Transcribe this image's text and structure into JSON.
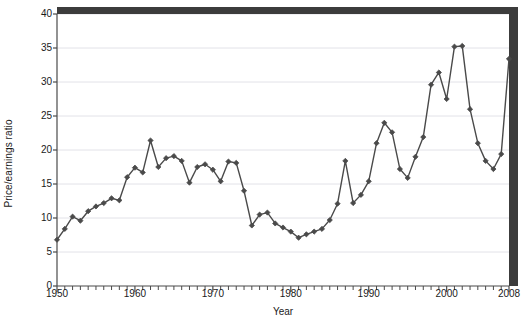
{
  "chart_data": {
    "type": "line",
    "title": "",
    "subtitle": "",
    "xlabel": "Year",
    "ylabel": "Price/earnings ratio",
    "xlim": [
      1950,
      2008
    ],
    "ylim": [
      0,
      40
    ],
    "xticks": [
      1950,
      1960,
      1970,
      1980,
      1990,
      2000,
      2008
    ],
    "xtick_labels": [
      "1950",
      "1960",
      "1970",
      "1980",
      "1990",
      "2000",
      "2008"
    ],
    "minor_xtick_interval": 1,
    "yticks": [
      0,
      5,
      10,
      15,
      20,
      25,
      30,
      35,
      40
    ],
    "ytick_labels": [
      "0",
      "5",
      "10",
      "15",
      "20",
      "25",
      "30",
      "35",
      "40"
    ],
    "grid": "horizontal",
    "legend": "none",
    "marker": "diamond",
    "series": [
      {
        "name": "Price/earnings ratio",
        "color": "#4a4a4a",
        "x": [
          1950,
          1951,
          1952,
          1953,
          1954,
          1955,
          1956,
          1957,
          1958,
          1959,
          1960,
          1961,
          1962,
          1963,
          1964,
          1965,
          1966,
          1967,
          1968,
          1969,
          1970,
          1971,
          1972,
          1973,
          1974,
          1975,
          1976,
          1977,
          1978,
          1979,
          1980,
          1981,
          1982,
          1983,
          1984,
          1985,
          1986,
          1987,
          1988,
          1989,
          1990,
          1991,
          1992,
          1993,
          1994,
          1995,
          1996,
          1997,
          1998,
          1999,
          2000,
          2001,
          2002,
          2003,
          2004,
          2005,
          2006,
          2007,
          2008
        ],
        "values": [
          6.8,
          8.4,
          10.2,
          9.6,
          11.0,
          11.7,
          12.2,
          12.9,
          12.6,
          16.0,
          17.4,
          16.7,
          21.4,
          17.5,
          18.8,
          19.1,
          18.4,
          15.2,
          17.5,
          17.9,
          17.1,
          15.4,
          18.3,
          18.1,
          14.0,
          8.9,
          10.5,
          10.8,
          9.2,
          8.6,
          8.0,
          7.1,
          7.6,
          8.0,
          8.4,
          9.7,
          12.1,
          18.4,
          12.2,
          13.4,
          15.4,
          21.0,
          24.0,
          22.6,
          17.2,
          15.9,
          19.0,
          21.9,
          29.6,
          31.4,
          27.5,
          35.2,
          35.3,
          26.0,
          21.0,
          18.4,
          17.2,
          19.4,
          33.4
        ]
      }
    ]
  },
  "axes": {
    "border_color": "#4a4a4a",
    "grid_color": "#e2e2e8",
    "frame_shadow_color": "#3c3c3c"
  },
  "labels": {
    "x_title": "Year",
    "y_title": "Price/earnings ratio"
  }
}
